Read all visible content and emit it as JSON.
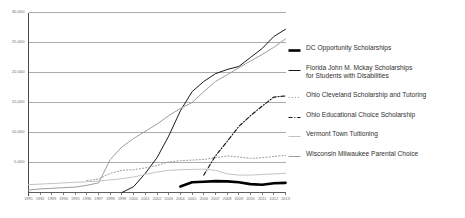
{
  "chart_data": {
    "type": "line",
    "title": "",
    "xlabel": "",
    "ylabel": "",
    "grid": true,
    "legend_position": "right",
    "ylim": [
      0,
      30000
    ],
    "yticks": [
      0,
      5000,
      10000,
      15000,
      20000,
      25000,
      30000
    ],
    "ytick_labels": [
      "",
      "5,000",
      "10,000",
      "15,000",
      "20,000",
      "25,000",
      "30,000"
    ],
    "x": [
      1991,
      1992,
      1993,
      1994,
      1995,
      1996,
      1997,
      1998,
      1999,
      2000,
      2001,
      2002,
      2003,
      2004,
      2005,
      2006,
      2007,
      2008,
      2009,
      2010,
      2011,
      2012,
      2013
    ],
    "xtick_labels": [
      "1991",
      "1992",
      "1993",
      "1994",
      "1995",
      "1996",
      "1997",
      "1998",
      "1999",
      "2000",
      "2001",
      "2002",
      "2003",
      "2004",
      "2005",
      "2006",
      "2007",
      "2008",
      "2009",
      "2010",
      "2011",
      "2012",
      "2013"
    ],
    "series": [
      {
        "name": "DC Opportunity Scholarships",
        "style": "thick-solid",
        "color": "#000000",
        "width": 2.6,
        "values": [
          null,
          null,
          null,
          null,
          null,
          null,
          null,
          null,
          null,
          null,
          null,
          null,
          null,
          1000,
          1700,
          1800,
          1900,
          1850,
          1700,
          1400,
          1300,
          1550,
          1600
        ]
      },
      {
        "name": "Florida John M. Mckay Scholarships for Students with Disabilities",
        "style": "solid",
        "color": "#1a1a1a",
        "width": 1.0,
        "values": [
          null,
          null,
          null,
          null,
          null,
          null,
          null,
          null,
          1,
          970,
          3200,
          5800,
          9400,
          13600,
          16800,
          18500,
          19800,
          20500,
          21000,
          22500,
          24000,
          26000,
          27200
        ]
      },
      {
        "name": "Ohio Cleveland Scholarship and Tutoring",
        "style": "dotted",
        "color": "#9a9a9a",
        "width": 1.0,
        "values": [
          null,
          null,
          null,
          null,
          null,
          1990,
          2250,
          3200,
          3700,
          3800,
          4100,
          4500,
          5100,
          5300,
          5400,
          5500,
          5800,
          6100,
          5900,
          5700,
          5800,
          6000,
          6200
        ]
      },
      {
        "name": "Ohio Educational Choice Scholarship",
        "style": "dash-dot",
        "color": "#111111",
        "width": 1.1,
        "values": [
          null,
          null,
          null,
          null,
          null,
          null,
          null,
          null,
          null,
          null,
          null,
          null,
          null,
          null,
          null,
          2900,
          6100,
          8500,
          11000,
          12800,
          14400,
          15900,
          16100
        ]
      },
      {
        "name": "Vermont Town Tuitioning",
        "style": "solid",
        "color": "#c4c4c4",
        "width": 1.0,
        "values": [
          1300,
          1400,
          1500,
          1600,
          1700,
          1800,
          1900,
          2100,
          2300,
          2600,
          3000,
          3400,
          3700,
          3800,
          3850,
          3900,
          3700,
          3100,
          2900,
          2900,
          3000,
          3100,
          3200
        ]
      },
      {
        "name": "Wisconsin Milwaukee Parental Choice",
        "style": "solid",
        "color": "#9e9e9e",
        "width": 1.0,
        "values": [
          400,
          600,
          700,
          800,
          900,
          1200,
          1600,
          5500,
          7600,
          9000,
          10200,
          11400,
          12800,
          14000,
          15000,
          16800,
          18500,
          19600,
          20800,
          21900,
          23000,
          24200,
          25600
        ]
      }
    ]
  },
  "legend": {
    "items": [
      {
        "label": "DC Opportunity Scholarships",
        "marker": "thick-solid-line-icon"
      },
      {
        "label": "Florida John M. Mckay Scholarships\nfor Students with Disabilities",
        "marker": "solid-line-icon"
      },
      {
        "label": "Ohio Cleveland Scholarship and Tutoring",
        "marker": "dotted-line-icon"
      },
      {
        "label": "Ohio Educational Choice Scholarship",
        "marker": "dash-dot-line-icon"
      },
      {
        "label": "Vermont Town Tuitioning",
        "marker": "light-solid-line-icon"
      },
      {
        "label": "Wisconsin Milwaukee Parental Choice",
        "marker": "gray-solid-line-icon"
      }
    ]
  },
  "colors": {
    "axis": "#4a4a4a",
    "grid": "#8f8f8f",
    "background": "#ffffff"
  }
}
